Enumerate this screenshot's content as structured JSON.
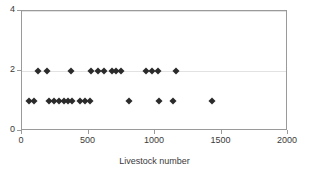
{
  "chart_data": {
    "type": "scatter",
    "title": "",
    "xlabel": "Livestock number",
    "ylabel": "",
    "xlim": [
      0,
      2000
    ],
    "ylim": [
      0,
      4
    ],
    "xticks": [
      0,
      500,
      1000,
      1500,
      2000
    ],
    "yticks": [
      0,
      2,
      4
    ],
    "xtick_labels": [
      "0",
      "500",
      "1000",
      "1500",
      "2000"
    ],
    "ytick_labels": [
      "0",
      "2",
      "4"
    ],
    "grid": "horizontal-light",
    "legend": "none",
    "marker": "diamond",
    "marker_color": "#2b2b2b",
    "series": [
      {
        "name": "observations",
        "points": [
          {
            "x": 120,
            "y": 2
          },
          {
            "x": 190,
            "y": 2
          },
          {
            "x": 370,
            "y": 2
          },
          {
            "x": 520,
            "y": 2
          },
          {
            "x": 570,
            "y": 2
          },
          {
            "x": 620,
            "y": 2
          },
          {
            "x": 680,
            "y": 2
          },
          {
            "x": 710,
            "y": 2
          },
          {
            "x": 745,
            "y": 2
          },
          {
            "x": 935,
            "y": 2
          },
          {
            "x": 980,
            "y": 2
          },
          {
            "x": 1020,
            "y": 2
          },
          {
            "x": 1155,
            "y": 2
          },
          {
            "x": 55,
            "y": 1
          },
          {
            "x": 90,
            "y": 1
          },
          {
            "x": 200,
            "y": 1
          },
          {
            "x": 240,
            "y": 1
          },
          {
            "x": 280,
            "y": 1
          },
          {
            "x": 315,
            "y": 1
          },
          {
            "x": 345,
            "y": 1
          },
          {
            "x": 375,
            "y": 1
          },
          {
            "x": 435,
            "y": 1
          },
          {
            "x": 475,
            "y": 1
          },
          {
            "x": 510,
            "y": 1
          },
          {
            "x": 805,
            "y": 1
          },
          {
            "x": 1030,
            "y": 1
          },
          {
            "x": 1135,
            "y": 1
          },
          {
            "x": 1430,
            "y": 1
          }
        ]
      }
    ]
  }
}
